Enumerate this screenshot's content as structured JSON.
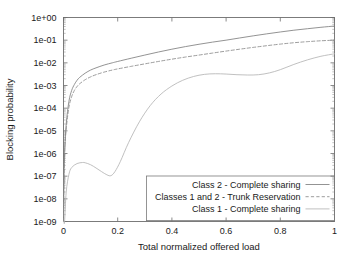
{
  "chart_data": {
    "type": "line",
    "title": "",
    "xlabel": "Total normalized offered load",
    "ylabel": "Blocking probability",
    "xlim": [
      0,
      1
    ],
    "ylim": [
      1e-09,
      1
    ],
    "yscale": "log",
    "xscale": "linear",
    "grid": false,
    "legend_position": "bottom-right",
    "xticks": [
      "0",
      "0.2",
      "0.4",
      "0.6",
      "0.8",
      "1"
    ],
    "xtick_values": [
      0,
      0.2,
      0.4,
      0.6,
      0.8,
      1
    ],
    "yticks": [
      "1e+00",
      "1e-01",
      "1e-02",
      "1e-03",
      "1e-04",
      "1e-05",
      "1e-06",
      "1e-07",
      "1e-08",
      "1e-09"
    ],
    "ytick_values": [
      1,
      0.1,
      0.01,
      0.001,
      0.0001,
      1e-05,
      1e-06,
      1e-07,
      1e-08,
      1e-09
    ],
    "series": [
      {
        "name": "Class 2 - Complete sharing",
        "style": "solid",
        "color": "#808080",
        "x": [
          0.004,
          0.01,
          0.02,
          0.03,
          0.04,
          0.05,
          0.06,
          0.08,
          0.1,
          0.12,
          0.15,
          0.18,
          0.2,
          0.25,
          0.3,
          0.35,
          0.4,
          0.45,
          0.5,
          0.55,
          0.6,
          0.65,
          0.7,
          0.75,
          0.8,
          0.85,
          0.9,
          0.95,
          1.0
        ],
        "y": [
          1e-06,
          2e-05,
          0.0002,
          0.0006,
          0.0011,
          0.0017,
          0.0023,
          0.0035,
          0.0048,
          0.006,
          0.008,
          0.01,
          0.0115,
          0.016,
          0.022,
          0.03,
          0.04,
          0.052,
          0.066,
          0.082,
          0.1,
          0.125,
          0.155,
          0.19,
          0.23,
          0.275,
          0.32,
          0.37,
          0.42
        ]
      },
      {
        "name": "Classes 1 and 2 - Trunk Reservation",
        "style": "dashed",
        "color": "#8a8a8a",
        "x": [
          0.004,
          0.01,
          0.02,
          0.03,
          0.04,
          0.05,
          0.06,
          0.08,
          0.1,
          0.12,
          0.15,
          0.18,
          0.2,
          0.25,
          0.3,
          0.35,
          0.4,
          0.45,
          0.5,
          0.55,
          0.6,
          0.65,
          0.7,
          0.75,
          0.8,
          0.85,
          0.9,
          0.95,
          1.0
        ],
        "y": [
          1e-06,
          1.2e-05,
          0.00011,
          0.00032,
          0.0006,
          0.0009,
          0.0012,
          0.0018,
          0.0024,
          0.003,
          0.0039,
          0.0048,
          0.0054,
          0.007,
          0.009,
          0.0115,
          0.0145,
          0.018,
          0.022,
          0.027,
          0.033,
          0.04,
          0.048,
          0.057,
          0.067,
          0.077,
          0.086,
          0.094,
          0.1
        ]
      },
      {
        "name": "Class 1 - Complete sharing",
        "style": "solid",
        "color": "#b5b5b5",
        "x": [
          0.004,
          0.01,
          0.02,
          0.03,
          0.05,
          0.07,
          0.08,
          0.1,
          0.12,
          0.14,
          0.16,
          0.175,
          0.19,
          0.21,
          0.24,
          0.28,
          0.32,
          0.36,
          0.4,
          0.44,
          0.48,
          0.52,
          0.56,
          0.6,
          0.64,
          0.68,
          0.72,
          0.76,
          0.8,
          0.85,
          0.9,
          0.95,
          1.0
        ],
        "y": [
          1e-09,
          2e-08,
          1.2e-07,
          2.4e-07,
          3.6e-07,
          4e-07,
          3.9e-07,
          3.2e-07,
          2.3e-07,
          1.6e-07,
          1.15e-07,
          1.05e-07,
          1.6e-07,
          4.5e-07,
          3e-06,
          2.5e-05,
          0.00013,
          0.00042,
          0.00095,
          0.0017,
          0.0025,
          0.0031,
          0.0033,
          0.0032,
          0.003,
          0.0029,
          0.003,
          0.0036,
          0.005,
          0.0085,
          0.0135,
          0.0195,
          0.025
        ]
      }
    ]
  },
  "legend": {
    "entries": [
      {
        "label": "Class 2 - Complete sharing",
        "style": "solid"
      },
      {
        "label": "Classes 1 and 2 - Trunk Reservation",
        "style": "dashed"
      },
      {
        "label": "Class 1 - Complete sharing",
        "style": "solid"
      }
    ]
  }
}
